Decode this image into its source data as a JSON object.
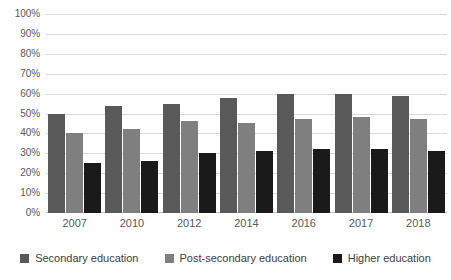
{
  "chart_data": {
    "type": "bar",
    "title": "",
    "subtitle": "",
    "xlabel": "",
    "ylabel": "",
    "categories": [
      "2007",
      "2010",
      "2012",
      "2014",
      "2016",
      "2017",
      "2018"
    ],
    "series": [
      {
        "name": "Secondary education",
        "color": "#595959",
        "values": [
          50,
          54,
          55,
          58,
          60,
          60,
          59
        ]
      },
      {
        "name": "Post-secondary education",
        "color": "#7f7f7f",
        "values": [
          40,
          42,
          46,
          45,
          47,
          48,
          47
        ]
      },
      {
        "name": "Higher education",
        "color": "#1a1a1a",
        "values": [
          25,
          26,
          30,
          31,
          32,
          32,
          31
        ]
      }
    ],
    "ylim": [
      0,
      100
    ],
    "ytick_step": 10,
    "ytick_labels": [
      "100%",
      "90%",
      "80%",
      "70%",
      "60%",
      "50%",
      "40%",
      "30%",
      "20%",
      "10%",
      "0%"
    ],
    "ytick_values": [
      100,
      90,
      80,
      70,
      60,
      50,
      40,
      30,
      20,
      10,
      0
    ],
    "grid": true,
    "grid_color": "#d9d9d9",
    "legend_position": "bottom",
    "annotations": []
  }
}
